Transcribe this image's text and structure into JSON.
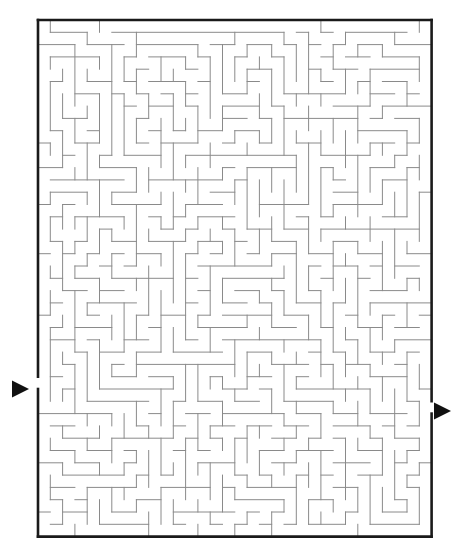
{
  "puzzle": {
    "type": "maze",
    "title": "Rectangular perfect maze puzzle",
    "description": "A printed black-and-white rectangular maze with a single entrance arrow on the left side and a single exit arrow on the right side.",
    "grid": {
      "columns": 32,
      "rows": 42
    },
    "geometry": {
      "origin_x": 38,
      "origin_y": 20,
      "cell_size": 12.3,
      "border_width": 2.6,
      "wall_width": 1.0
    },
    "colors": {
      "background": "#ffffff",
      "border": "#1a1a1a",
      "wall": "#8a8a8a",
      "marker": "#111111"
    },
    "entrance": {
      "label": "entrance",
      "side": "left",
      "row": 29,
      "arrow_x": 12,
      "arrow_y": 389,
      "arrow_size": 17
    },
    "exit": {
      "label": "exit",
      "side": "right",
      "row": 31,
      "arrow_x": 434,
      "arrow_y": 411,
      "arrow_size": 17
    },
    "h_walls": [
      "11111111111111111111111111111111",
      "00100000011000000001010001100100",
      "01001000100101001000001001001010",
      "10010100010010100100110100100001",
      "00101001001001010001001010010100",
      "10010010100100101010100101001010",
      "01001100010011010100011010100101",
      "10100010101000101001100101010010",
      "01010101010101010010011010101001",
      "10101010101010100101100101010110",
      "01010101001001011010010010101001",
      "10101010110110100101101001010110",
      "00010101001001011010010110101001",
      "10101010110100100101101001010010",
      "01010100101011011010010110101101",
      "10101011010100100101101001010010",
      "01010100101011010010010110101101",
      "10101011010100101101101001010010",
      "00101000101011010010010110100101",
      "11010111010100101101101001011010",
      "00101000101011010010010110100101",
      "10010111010100101101001001011010",
      "01101000101011010010110110100101",
      "10010111010100101101001001011010",
      "01101000101001010010110110100101",
      "10010111010110101101001001011010",
      "01001000101001010010110110100101",
      "10110111010110101101001001011010",
      "01001000101001010010110110100101",
      "10110101010110101101001001011010",
      "01001010101001010010110110100101",
      "10110101010110101101001001011010",
      "01001010101001010010110100100101",
      "10110101010110101101001011011010",
      "01001010101001010010110100100101",
      "10110101010110101001001011011010",
      "01001010101001010110110100100101",
      "10110101010110101001001011011010",
      "01001010100101010110110100100101",
      "10110101011010101001001011011010",
      "01001010100101010110110100100101",
      "10110101011010101001001011011010",
      "11111111111111111111111111111111"
    ],
    "v_walls": [
      "100100010010010010010001001001001",
      "100100100100100101001001001010011",
      "101001001001001010010010010100101",
      "100100100100100101001001001010011",
      "101001001001001010010010010100101",
      "100100100100100101001001001010011",
      "101001001001001010010010010100101",
      "100100100100100101001001001010011",
      "101001001001001010010010010100101",
      "100100100100100101001001001010011",
      "101001001001001010010010010100101",
      "100100100100100101001001001010011",
      "101001001001001010010010010100101",
      "100100100100100101001001001010011",
      "101001001001001010010010010100101",
      "100100100100100101001001001010011",
      "101001001001001010010010010100101",
      "100100100100100101001001001010011",
      "101001001001001010010010010100101",
      "100100100100100101001001001010011",
      "101001001001001010010010010100101",
      "100100100100100101001001001010011",
      "101001001001001010010010010100101",
      "100100100100100101001001001010011",
      "101001001001001010010010010100101",
      "100100100100100101001001001010011",
      "101001001001001010010010010100101",
      "100100100100100101001001001010011",
      "101001001001001010010010010100101",
      "000100100100100101001001001010011",
      "101001001001001010010010010100101",
      "100100100100100101001001001010010",
      "101001001001001010010010010100101",
      "100100100100100101001001001010011",
      "101001001001001010010010010100101",
      "100100100100100101001001001010011",
      "101001001001001010010010010100101",
      "100100100100100101001001001010011",
      "101001001001001010010010010100101",
      "100100100100100101001001001010011",
      "101001001001001010010010010100101",
      "100100100100100101001001001010011"
    ]
  }
}
